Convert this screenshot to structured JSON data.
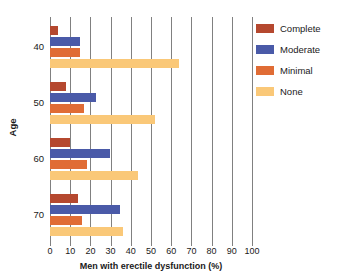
{
  "chart_data": {
    "type": "bar",
    "orientation": "horizontal",
    "title": "",
    "xlabel": "Men with erectile dysfunction (%)",
    "ylabel": "Age",
    "categories": [
      "40",
      "50",
      "60",
      "70"
    ],
    "xlim": [
      0,
      100
    ],
    "xticks": [
      0,
      10,
      20,
      30,
      40,
      50,
      60,
      70,
      80,
      90,
      100
    ],
    "xticklabels": [
      "0",
      "10",
      "20",
      "30",
      "40",
      "50",
      "60",
      "70",
      "80",
      "90",
      "100"
    ],
    "grid": "vertical",
    "legend_position": "upper right",
    "series": [
      {
        "name": "Complete",
        "color": "#b5482f",
        "values": [
          4,
          8,
          10,
          14
        ]
      },
      {
        "name": "Moderate",
        "color": "#4a5aa8",
        "values": [
          15,
          23,
          29.5,
          34.5
        ]
      },
      {
        "name": "Minimal",
        "color": "#e06c35",
        "values": [
          15,
          17,
          18.5,
          16
        ]
      },
      {
        "name": "None",
        "color": "#fac878",
        "values": [
          64,
          52,
          43.5,
          36
        ]
      }
    ]
  },
  "legend": {
    "items": [
      {
        "label": "Complete",
        "color": "#b5482f"
      },
      {
        "label": "Moderate",
        "color": "#4a5aa8"
      },
      {
        "label": "Minimal",
        "color": "#e06c35"
      },
      {
        "label": "None",
        "color": "#fac878"
      }
    ]
  }
}
